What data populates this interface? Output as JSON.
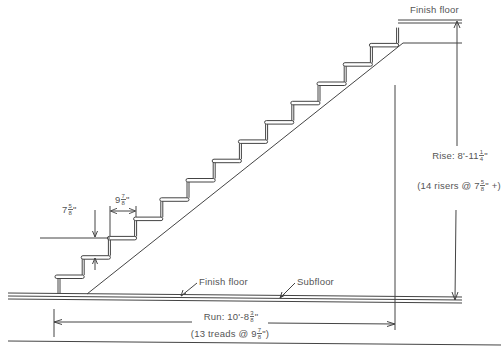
{
  "diagram": {
    "type": "stair-section",
    "labels": {
      "top_floor": "Finish floor",
      "bottom_finish_floor": "Finish floor",
      "subfloor": "Subfloor"
    },
    "rise": {
      "title_prefix": "Rise: 8'-11",
      "title_frac_num": "1",
      "title_frac_den": "4",
      "title_suffix": "\"",
      "detail_prefix": "(14 risers @ 7",
      "detail_frac_num": "5",
      "detail_frac_den": "8",
      "detail_suffix": "\" +)"
    },
    "run": {
      "title_prefix": "Run: 10'-8",
      "title_frac_num": "3",
      "title_frac_den": "8",
      "title_suffix": "\"",
      "detail_prefix": "(13 treads @ 9",
      "detail_frac_num": "7",
      "detail_frac_den": "8",
      "detail_suffix": "\")"
    },
    "riser_dim": {
      "whole": "7",
      "frac_num": "5",
      "frac_den": "8",
      "suffix": "\""
    },
    "tread_dim": {
      "whole": "9",
      "frac_num": "7",
      "frac_den": "8",
      "suffix": "\""
    },
    "counts": {
      "risers": 14,
      "treads": 13
    },
    "colors": {
      "line": "#444444",
      "text": "#555555",
      "background": "#ffffff"
    }
  }
}
